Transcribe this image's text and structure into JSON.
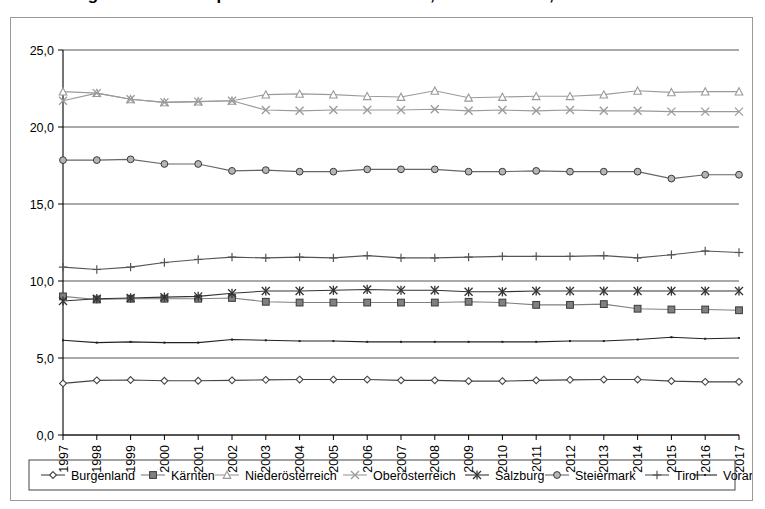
{
  "title": {
    "text": "Abbildung: Arbeitslosenquote nach Bundesländern, 1997 bis 2017, in Prozent",
    "visible_fragment": true
  },
  "chart_data": {
    "type": "line",
    "title": "",
    "xlabel": "",
    "ylabel": "",
    "ylim": [
      0.0,
      25.0
    ],
    "yticks": [
      "0,0",
      "5,0",
      "10,0",
      "15,0",
      "20,0",
      "25,0"
    ],
    "ytick_values": [
      0,
      5,
      10,
      15,
      20,
      25
    ],
    "grid": true,
    "legend_position": "bottom",
    "x": [
      "1997",
      "1998",
      "1999",
      "2000",
      "2001",
      "2002",
      "2003",
      "2004",
      "2005",
      "2006",
      "2007",
      "2008",
      "2009",
      "2010",
      "2011",
      "2012",
      "2013",
      "2014",
      "2015",
      "2016",
      "2017"
    ],
    "categories": [
      "1997",
      "1998",
      "1999",
      "2000",
      "2001",
      "2002",
      "2003",
      "2004",
      "2005",
      "2006",
      "2007",
      "2008",
      "2009",
      "2010",
      "2011",
      "2012",
      "2013",
      "2014",
      "2015",
      "2016",
      "2017"
    ],
    "series": [
      {
        "name": "Burgenland",
        "marker": "diamond",
        "color": "#444444",
        "values": [
          3.35,
          3.55,
          3.57,
          3.52,
          3.52,
          3.55,
          3.58,
          3.6,
          3.6,
          3.6,
          3.55,
          3.55,
          3.5,
          3.5,
          3.55,
          3.58,
          3.6,
          3.6,
          3.5,
          3.45,
          3.45
        ]
      },
      {
        "name": "Kärnten",
        "marker": "square-filled",
        "color": "#808080",
        "values": [
          9.0,
          8.8,
          8.85,
          8.85,
          8.85,
          8.9,
          8.65,
          8.6,
          8.6,
          8.6,
          8.6,
          8.6,
          8.65,
          8.6,
          8.45,
          8.45,
          8.5,
          8.2,
          8.15,
          8.15,
          8.1
        ]
      },
      {
        "name": "Niederösterreich",
        "marker": "triangle",
        "color": "#9a9a9a",
        "values": [
          22.3,
          22.2,
          21.8,
          21.6,
          21.65,
          21.7,
          22.1,
          22.15,
          22.1,
          22.0,
          21.95,
          22.35,
          21.9,
          21.95,
          22.0,
          22.0,
          22.1,
          22.35,
          22.25,
          22.3,
          22.3
        ]
      },
      {
        "name": "Oberösterreich",
        "marker": "x",
        "color": "#9a9a9a",
        "values": [
          21.7,
          22.2,
          21.8,
          21.6,
          21.65,
          21.7,
          21.1,
          21.05,
          21.1,
          21.1,
          21.1,
          21.15,
          21.05,
          21.1,
          21.05,
          21.1,
          21.05,
          21.05,
          21.0,
          21.0,
          21.0
        ]
      },
      {
        "name": "Salzburg",
        "marker": "asterisk",
        "color": "#333333",
        "values": [
          8.7,
          8.85,
          8.9,
          8.95,
          9.0,
          9.2,
          9.35,
          9.35,
          9.4,
          9.45,
          9.4,
          9.4,
          9.3,
          9.3,
          9.35,
          9.35,
          9.35,
          9.35,
          9.35,
          9.35,
          9.35
        ]
      },
      {
        "name": "Steiermark",
        "marker": "circle",
        "color": "#666666",
        "values": [
          17.85,
          17.85,
          17.9,
          17.6,
          17.6,
          17.15,
          17.2,
          17.1,
          17.1,
          17.25,
          17.25,
          17.25,
          17.1,
          17.1,
          17.15,
          17.1,
          17.1,
          17.1,
          16.65,
          16.9,
          16.9
        ]
      },
      {
        "name": "Tirol",
        "marker": "plus",
        "color": "#555555",
        "values": [
          10.9,
          10.75,
          10.9,
          11.2,
          11.4,
          11.55,
          11.5,
          11.55,
          11.5,
          11.65,
          11.5,
          11.5,
          11.55,
          11.6,
          11.6,
          11.6,
          11.65,
          11.5,
          11.7,
          11.95,
          11.85
        ]
      },
      {
        "name": "Vorarlberg",
        "marker": "none",
        "color": "#222222",
        "values": [
          6.15,
          6.0,
          6.05,
          6.0,
          6.0,
          6.2,
          6.15,
          6.1,
          6.1,
          6.05,
          6.05,
          6.05,
          6.05,
          6.05,
          6.05,
          6.1,
          6.1,
          6.2,
          6.35,
          6.25,
          6.3
        ]
      }
    ]
  },
  "legend": {
    "items": [
      {
        "label": "Burgenland",
        "marker": "diamond"
      },
      {
        "label": "Kärnten",
        "marker": "square-filled"
      },
      {
        "label": "Niederösterreich",
        "marker": "triangle"
      },
      {
        "label": "Oberösterreich",
        "marker": "x"
      },
      {
        "label": "Salzburg",
        "marker": "asterisk"
      },
      {
        "label": "Steiermark",
        "marker": "circle"
      },
      {
        "label": "Tirol",
        "marker": "plus"
      },
      {
        "label": "Vorarlberg",
        "marker": "none"
      }
    ]
  }
}
